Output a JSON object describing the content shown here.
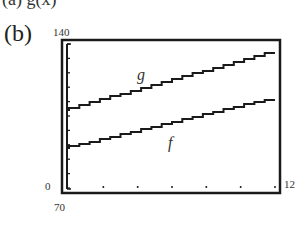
{
  "header_fragment": "(a)  g(x)",
  "panel_label": "(b)",
  "window": {
    "ymax_label": "140",
    "ymin_label": "70",
    "xmin_label": "0",
    "xmax_label": "12"
  },
  "curve_labels": {
    "g": "g",
    "f": "f"
  },
  "chart_data": {
    "type": "line",
    "title": "",
    "xlabel": "",
    "ylabel": "",
    "xlim": [
      0,
      12
    ],
    "ylim": [
      70,
      140
    ],
    "x_ticks": [
      0,
      2,
      4,
      6,
      8,
      10,
      12
    ],
    "y_ticks": [
      70,
      77,
      84,
      91,
      98,
      105,
      112,
      119,
      126,
      133,
      140
    ],
    "grid": false,
    "legend": "inline labels",
    "series": [
      {
        "name": "g",
        "x": [
          0,
          12
        ],
        "y": [
          107.5,
          135.5
        ]
      },
      {
        "name": "f",
        "x": [
          0,
          12
        ],
        "y": [
          89,
          113
        ]
      }
    ],
    "annotations": [
      "g",
      "f"
    ],
    "style": "graphing calculator window, stair-stepped pixel lines"
  }
}
